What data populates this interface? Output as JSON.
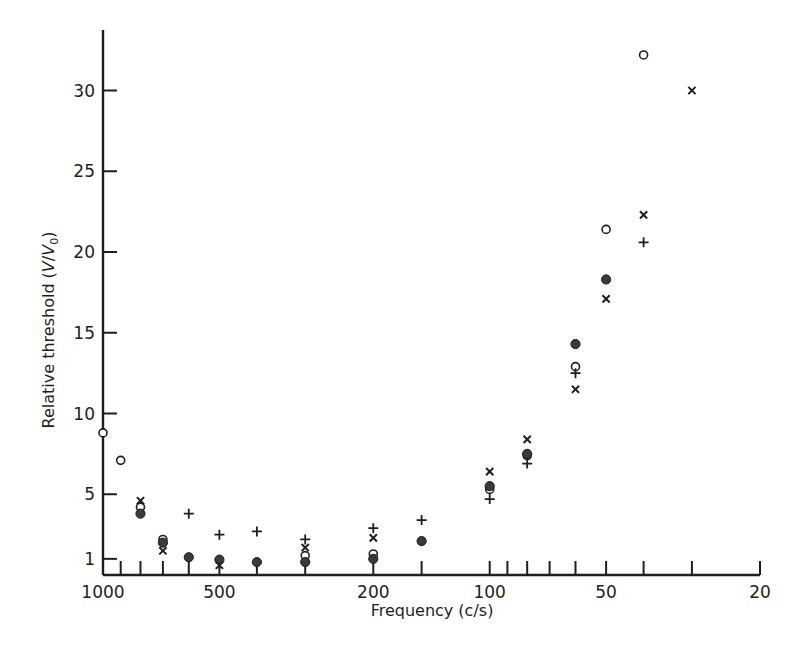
{
  "chart_data": {
    "type": "scatter",
    "title": "",
    "xlabel": "Frequency (c/s)",
    "ylabel": "Relative threshold (V/V0)",
    "xscale": "log",
    "x_reversed": true,
    "xlim": [
      1000,
      20
    ],
    "ylim": [
      0,
      34
    ],
    "grid": false,
    "legend": "none",
    "x_tick_labels": [
      1000,
      500,
      200,
      100,
      50,
      20
    ],
    "x_minor_ticks": [
      900,
      800,
      700,
      600,
      400,
      300,
      150,
      90,
      80,
      70,
      60,
      40,
      30
    ],
    "y_tick_labels": [
      1,
      5,
      10,
      15,
      20,
      25,
      30
    ],
    "series": [
      {
        "name": "open-circle",
        "marker": "o",
        "points": [
          [
            1000,
            8.8
          ],
          [
            900,
            7.1
          ],
          [
            800,
            4.2
          ],
          [
            700,
            2.2
          ],
          [
            300,
            1.2
          ],
          [
            200,
            1.3
          ],
          [
            100,
            5.3
          ],
          [
            80,
            7.4
          ],
          [
            60,
            12.9
          ],
          [
            50,
            21.4
          ],
          [
            40,
            32.2
          ]
        ]
      },
      {
        "name": "filled-circle",
        "marker": "filled",
        "points": [
          [
            800,
            3.8
          ],
          [
            700,
            2.0
          ],
          [
            600,
            1.1
          ],
          [
            500,
            0.95
          ],
          [
            400,
            0.8
          ],
          [
            300,
            0.8
          ],
          [
            200,
            1.0
          ],
          [
            150,
            2.1
          ],
          [
            100,
            5.5
          ],
          [
            80,
            7.5
          ],
          [
            60,
            14.3
          ],
          [
            50,
            18.3
          ]
        ]
      },
      {
        "name": "cross-x",
        "marker": "x",
        "points": [
          [
            800,
            4.6
          ],
          [
            700,
            1.5
          ],
          [
            500,
            0.6
          ],
          [
            300,
            1.7
          ],
          [
            200,
            2.3
          ],
          [
            100,
            6.4
          ],
          [
            80,
            8.4
          ],
          [
            60,
            11.5
          ],
          [
            50,
            17.1
          ],
          [
            40,
            22.3
          ],
          [
            30,
            30.0
          ]
        ]
      },
      {
        "name": "plus",
        "marker": "+",
        "points": [
          [
            600,
            3.8
          ],
          [
            500,
            2.5
          ],
          [
            400,
            2.7
          ],
          [
            300,
            2.2
          ],
          [
            200,
            2.9
          ],
          [
            150,
            3.4
          ],
          [
            100,
            4.7
          ],
          [
            80,
            6.9
          ],
          [
            60,
            12.5
          ],
          [
            40,
            20.6
          ]
        ]
      }
    ]
  },
  "labels": {
    "xlabel": "Frequency (c/s)",
    "ylabel_main": "Relative threshold (",
    "ylabel_v": "V",
    "ylabel_slash": "/",
    "ylabel_v0": "V",
    "ylabel_sub": "0",
    "ylabel_close": ")"
  },
  "style": {
    "ink": "#1e1e1e",
    "background": "#ffffff"
  }
}
